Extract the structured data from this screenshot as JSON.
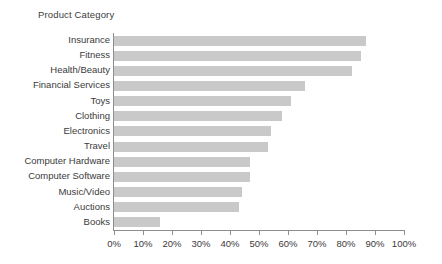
{
  "chart_data": {
    "type": "bar",
    "orientation": "horizontal",
    "title": "Product Category",
    "xlabel": "",
    "ylabel": "Product Category",
    "xlim": [
      0,
      100
    ],
    "xtick_labels": [
      "0%",
      "10%",
      "20%",
      "30%",
      "40%",
      "50%",
      "60%",
      "70%",
      "80%",
      "90%",
      "100%"
    ],
    "xticks": [
      0,
      10,
      20,
      30,
      40,
      50,
      60,
      70,
      80,
      90,
      100
    ],
    "grid": false,
    "legend": false,
    "bar_color": "#c9c9c9",
    "axis_color": "#8d8d8d",
    "text_color": "#3b3b3b",
    "categories": [
      "Insurance",
      "Fitness",
      "Health/Beauty",
      "Financial Services",
      "Toys",
      "Clothing",
      "Electronics",
      "Travel",
      "Computer Hardware",
      "Computer Software",
      "Music/Video",
      "Auctions",
      "Books"
    ],
    "values": [
      87,
      85,
      82,
      66,
      61,
      58,
      54,
      53,
      47,
      47,
      44,
      43,
      16
    ]
  }
}
